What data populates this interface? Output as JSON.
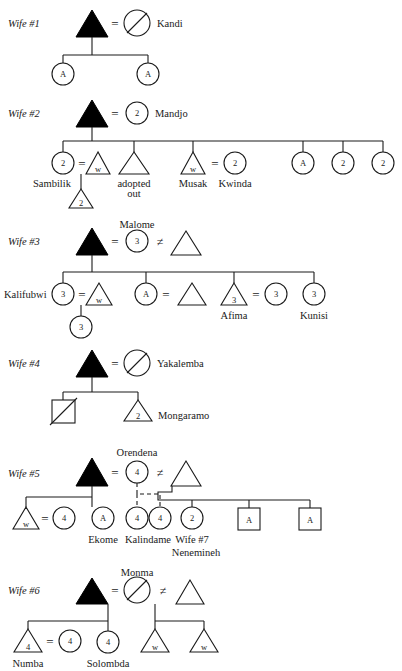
{
  "diagram": {
    "colors": {
      "ink": "#1a1a1a",
      "fill_male_ego": "#000000",
      "background": "#ffffff"
    },
    "symbols": {
      "equals": "=",
      "not_equals": "≠",
      "filled_triangle": "filled-triangle-male-ego",
      "slashed_circle": "deceased-female",
      "slashed_square": "deceased-male"
    },
    "sections": [
      {
        "id": "wife1",
        "label": "Wife #1",
        "spouse_name": "Kandi",
        "spouse_symbol": "deceased-female",
        "children": [
          {
            "shape": "circle",
            "glyph": "A",
            "name": ""
          },
          {
            "shape": "circle",
            "glyph": "A",
            "name": ""
          }
        ]
      },
      {
        "id": "wife2",
        "label": "Wife #2",
        "spouse_name": "Mandjo",
        "spouse_symbol": "circle",
        "spouse_glyph": "2",
        "children": [
          {
            "shape": "circle",
            "glyph": "2",
            "name": "Sambilik"
          },
          {
            "shape": "triangle",
            "glyph": "w",
            "name": ""
          },
          {
            "shape": "triangle",
            "glyph": "",
            "name": "adopted out"
          },
          {
            "shape": "triangle",
            "glyph": "w",
            "name": "Musak"
          },
          {
            "shape": "circle",
            "glyph": "2",
            "name": "Kwinda"
          },
          {
            "shape": "circle",
            "glyph": "A",
            "name": ""
          },
          {
            "shape": "circle",
            "glyph": "2",
            "name": ""
          },
          {
            "shape": "circle",
            "glyph": "2",
            "name": ""
          }
        ],
        "grandchildren": [
          {
            "shape": "triangle",
            "glyph": "2",
            "name": ""
          }
        ]
      },
      {
        "id": "wife3",
        "label": "Wife #3",
        "spouse_name": "Malome",
        "spouse_symbol": "circle",
        "spouse_glyph": "3",
        "second_husband": {
          "shape": "triangle",
          "glyph": ""
        },
        "children": [
          {
            "shape": "circle",
            "glyph": "3",
            "name": "Kalifubwi"
          },
          {
            "shape": "triangle",
            "glyph": "w",
            "name": ""
          },
          {
            "shape": "circle",
            "glyph": "A",
            "name": ""
          },
          {
            "shape": "triangle",
            "glyph": "",
            "name": ""
          },
          {
            "shape": "triangle",
            "glyph": "3",
            "name": "Afima"
          },
          {
            "shape": "circle",
            "glyph": "3",
            "name": ""
          },
          {
            "shape": "circle",
            "glyph": "3",
            "name": "Kunisi"
          }
        ],
        "grandchildren": [
          {
            "shape": "circle",
            "glyph": "3",
            "name": ""
          }
        ]
      },
      {
        "id": "wife4",
        "label": "Wife #4",
        "spouse_name": "Yakalemba",
        "spouse_symbol": "deceased-female",
        "children": [
          {
            "shape": "deceased-square",
            "glyph": "",
            "name": ""
          },
          {
            "shape": "triangle",
            "glyph": "2",
            "name": "Mongaramo"
          }
        ]
      },
      {
        "id": "wife5",
        "label": "Wife #5",
        "spouse_name": "Orendena",
        "spouse_symbol": "circle",
        "spouse_glyph": "4",
        "second_husband": {
          "shape": "triangle",
          "glyph": ""
        },
        "children": [
          {
            "shape": "triangle",
            "glyph": "w",
            "name": ""
          },
          {
            "shape": "circle",
            "glyph": "4",
            "name": ""
          },
          {
            "shape": "circle",
            "glyph": "A",
            "name": "Ekome"
          },
          {
            "shape": "circle",
            "glyph": "4",
            "name": "Kalindame"
          },
          {
            "shape": "circle",
            "glyph": "4",
            "name": ""
          },
          {
            "shape": "circle",
            "glyph": "2",
            "name": "Wife #7"
          },
          {
            "shape": "square",
            "glyph": "A",
            "name": ""
          },
          {
            "shape": "square",
            "glyph": "A",
            "name": ""
          }
        ],
        "extra_name": "Nenemineh"
      },
      {
        "id": "wife6",
        "label": "Wife #6",
        "spouse_name": "Monma",
        "spouse_symbol": "deceased-female",
        "second_husband": {
          "shape": "triangle",
          "glyph": ""
        },
        "children": [
          {
            "shape": "triangle",
            "glyph": "4",
            "name": "Numba"
          },
          {
            "shape": "circle",
            "glyph": "4",
            "name": ""
          },
          {
            "shape": "circle",
            "glyph": "4",
            "name": "Solombda"
          },
          {
            "shape": "triangle",
            "glyph": "w",
            "name": ""
          },
          {
            "shape": "triangle",
            "glyph": "w",
            "name": ""
          }
        ]
      }
    ]
  }
}
